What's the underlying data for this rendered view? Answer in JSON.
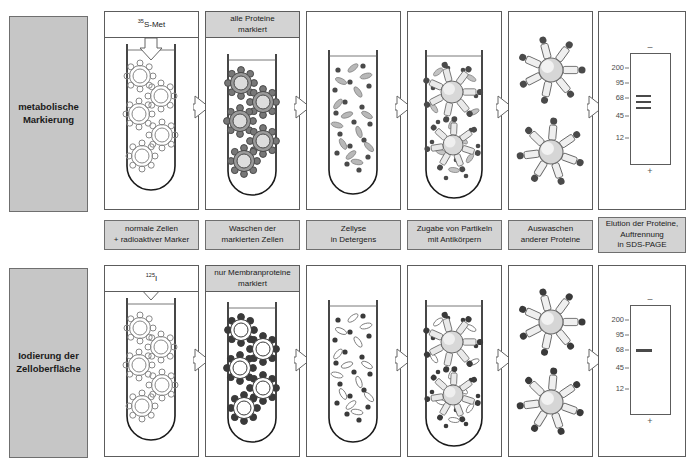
{
  "figure": {
    "colors": {
      "row_label_bg": "#c6c6c6",
      "caption_bg": "#d3d3d3",
      "header_gray_bg": "#d3d3d3",
      "border": "#5c5c5c",
      "page_bg": "#ffffff",
      "band": "#4a4a4a",
      "cell_labeled": "#9a9a9a",
      "dot_dark": "#4a4a4a"
    }
  },
  "rows": [
    {
      "id": "metabolic",
      "label_line1": "metabolische",
      "label_line2": "Markierung",
      "tracer_label": "35S-Met",
      "tracer_isotope": "35",
      "tracer_element": "S-Met",
      "marker_header": {
        "line1": "alle Proteine",
        "line2": "markiert",
        "style": "gray"
      },
      "tracer_header_style": "white",
      "gel": {
        "mw_markers": [
          "200",
          "95",
          "68",
          "45",
          "12"
        ],
        "bands": [
          {
            "mw_position": 68,
            "thickness": 2,
            "label": "Bande 1"
          },
          {
            "mw_position": 64,
            "thickness": 2,
            "label": "Bande 2"
          },
          {
            "mw_position": 60,
            "thickness": 2,
            "label": "Bande 3"
          }
        ],
        "band_count": 3,
        "top_pole": "–",
        "bottom_pole": "+"
      }
    },
    {
      "id": "iodination",
      "label_line1": "Iodierung der",
      "label_line2": "Zelloberfläche",
      "tracer_label": "125I",
      "tracer_isotope": "125",
      "tracer_element": "I",
      "marker_header": {
        "line1": "nur Membranproteine",
        "line2": "markiert",
        "style": "gray"
      },
      "tracer_header_style": "white",
      "gel": {
        "mw_markers": [
          "200",
          "95",
          "68",
          "45",
          "12"
        ],
        "bands": [
          {
            "mw_position": 68,
            "thickness": 3,
            "label": "Bande 1"
          }
        ],
        "band_count": 1,
        "top_pole": "–",
        "bottom_pole": "+"
      }
    }
  ],
  "captions": [
    {
      "id": "step1",
      "line1": "normale Zellen",
      "line2": "+ radioaktiver Marker",
      "line3": ""
    },
    {
      "id": "step2",
      "line1": "Waschen der",
      "line2": "markierten Zellen",
      "line3": ""
    },
    {
      "id": "step3",
      "line1": "Zellyse",
      "line2": "in Detergens",
      "line3": ""
    },
    {
      "id": "step4",
      "line1": "Zugabe von Partikeln",
      "line2": "mit Antikörpern",
      "line3": ""
    },
    {
      "id": "step5",
      "line1": "Auswaschen",
      "line2": "anderer Proteine",
      "line3": ""
    },
    {
      "id": "step6",
      "line1": "Elution der Proteine,",
      "line2": "Auftrennung",
      "line3": "in SDS-PAGE"
    }
  ]
}
